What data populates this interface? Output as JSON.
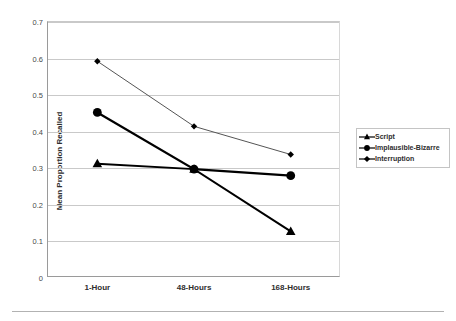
{
  "chart_data": {
    "type": "line",
    "title": "",
    "xlabel": "",
    "ylabel": "Mean Proportion Recalled",
    "categories": [
      "1-Hour",
      "48-Hours",
      "168-Hours"
    ],
    "ylim": [
      0,
      0.7
    ],
    "ytick_labels": [
      "0.7",
      "0.6",
      "0.5",
      "0.4",
      "0.3",
      "0.2",
      "0.1",
      "0"
    ],
    "ytick_values": [
      0.7,
      0.6,
      0.5,
      0.4,
      0.3,
      0.2,
      0.1,
      0
    ],
    "grid": true,
    "legend_position": "right",
    "series": [
      {
        "name": "Script",
        "marker": "triangle",
        "values": [
          0.31,
          0.295,
          0.125
        ]
      },
      {
        "name": "Implausible-Bizarre",
        "marker": "circle",
        "values": [
          0.45,
          0.295,
          0.277
        ]
      },
      {
        "name": "Interruption",
        "marker": "diamond",
        "values": [
          0.59,
          0.412,
          0.335
        ]
      }
    ]
  },
  "axis": {
    "y_title": "Mean Proportion Recalled"
  },
  "legend": {
    "items": [
      {
        "label": "Script"
      },
      {
        "label": "Implausible-Bizarre"
      },
      {
        "label": "Interruption"
      }
    ]
  },
  "colors": {
    "series_line": "#000000",
    "interruption_line": "#555555",
    "gridline": "#c9c9c9",
    "axis": "#9a9a9a",
    "text": "#2e2e2e"
  }
}
